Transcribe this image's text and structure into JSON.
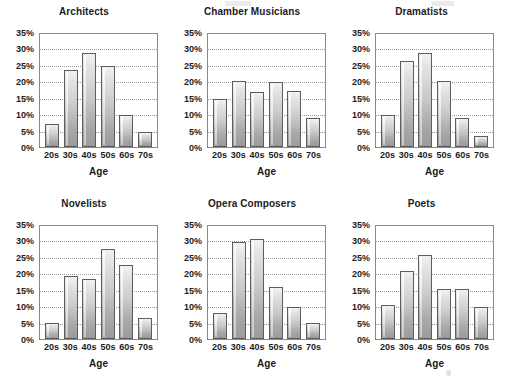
{
  "figure": {
    "background": "#ffffff",
    "bar_fill_light": "#f2f2f2",
    "bar_fill_dark": "#9b9b9b",
    "bar_outline": "#5d5d5d",
    "gridline_color": "#9a9a9a",
    "axis_color": "#8a8a8a"
  },
  "chart_data": [
    {
      "type": "bar",
      "title": "Architects",
      "xlabel": "Age",
      "ylabel": "",
      "categories": [
        "20s",
        "30s",
        "40s",
        "50s",
        "60s",
        "70s"
      ],
      "values": [
        7,
        24,
        29,
        25,
        10,
        4.5
      ],
      "ylim": [
        0,
        35
      ],
      "yticks": [
        "0%",
        "5%",
        "10%",
        "15%",
        "20%",
        "25%",
        "30%",
        "35%"
      ],
      "ytick_values": [
        0,
        5,
        10,
        15,
        20,
        25,
        30,
        35
      ],
      "grid": true,
      "legend": "none"
    },
    {
      "type": "bar",
      "title": "Chamber Musicians",
      "xlabel": "Age",
      "ylabel": "",
      "categories": [
        "20s",
        "30s",
        "40s",
        "50s",
        "60s",
        "70s"
      ],
      "values": [
        15,
        20.5,
        17,
        20,
        17.5,
        9
      ],
      "ylim": [
        0,
        35
      ],
      "yticks": [
        "0%",
        "5%",
        "10%",
        "15%",
        "20%",
        "25%",
        "30%",
        "35%"
      ],
      "ytick_values": [
        0,
        5,
        10,
        15,
        20,
        25,
        30,
        35
      ],
      "grid": true,
      "legend": "none"
    },
    {
      "type": "bar",
      "title": "Dramatists",
      "xlabel": "Age",
      "ylabel": "",
      "categories": [
        "20s",
        "30s",
        "40s",
        "50s",
        "60s",
        "70s"
      ],
      "values": [
        10,
        26.5,
        29,
        20.5,
        9,
        3.5
      ],
      "ylim": [
        0,
        35
      ],
      "yticks": [
        "0%",
        "5%",
        "10%",
        "15%",
        "20%",
        "25%",
        "30%",
        "35%"
      ],
      "ytick_values": [
        0,
        5,
        10,
        15,
        20,
        25,
        30,
        35
      ],
      "grid": true,
      "legend": "none"
    },
    {
      "type": "bar",
      "title": "Novelists",
      "xlabel": "Age",
      "ylabel": "",
      "categories": [
        "20s",
        "30s",
        "40s",
        "50s",
        "60s",
        "70s"
      ],
      "values": [
        5,
        19.5,
        18.5,
        28,
        23,
        6.5
      ],
      "ylim": [
        0,
        35
      ],
      "yticks": [
        "0%",
        "5%",
        "10%",
        "15%",
        "20%",
        "25%",
        "30%",
        "35%"
      ],
      "ytick_values": [
        0,
        5,
        10,
        15,
        20,
        25,
        30,
        35
      ],
      "grid": true,
      "legend": "none"
    },
    {
      "type": "bar",
      "title": "Opera Composers",
      "xlabel": "Age",
      "ylabel": "",
      "categories": [
        "20s",
        "30s",
        "40s",
        "50s",
        "60s",
        "70s"
      ],
      "values": [
        8,
        30,
        31,
        16,
        10,
        5
      ],
      "ylim": [
        0,
        35
      ],
      "yticks": [
        "0%",
        "5%",
        "10%",
        "15%",
        "20%",
        "25%",
        "30%",
        "35%"
      ],
      "ytick_values": [
        0,
        5,
        10,
        15,
        20,
        25,
        30,
        35
      ],
      "grid": true,
      "legend": "none"
    },
    {
      "type": "bar",
      "title": "Poets",
      "xlabel": "Age",
      "ylabel": "",
      "categories": [
        "20s",
        "30s",
        "40s",
        "50s",
        "60s",
        "70s"
      ],
      "values": [
        10.5,
        21,
        26,
        15.5,
        15.5,
        10
      ],
      "ylim": [
        0,
        35
      ],
      "yticks": [
        "0%",
        "5%",
        "10%",
        "15%",
        "20%",
        "25%",
        "30%",
        "35%"
      ],
      "ytick_values": [
        0,
        5,
        10,
        15,
        20,
        25,
        30,
        35
      ],
      "grid": true,
      "legend": "none"
    }
  ]
}
